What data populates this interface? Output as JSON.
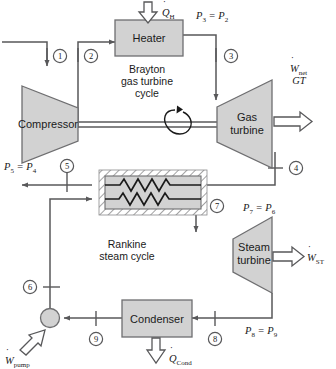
{
  "diagram": {
    "colors": {
      "line": "#58585a",
      "component_fill": "#d2d2d2",
      "component_stroke": "#6e6e70",
      "hatch_stroke": "#8a8a8c",
      "text": "#1a1a1a",
      "background": "#ffffff"
    },
    "cycles": {
      "brayton": {
        "line1": "Brayton",
        "line2": "gas turbine",
        "line3": "cycle"
      },
      "rankine": {
        "line1": "Rankine",
        "line2": "steam cycle"
      }
    },
    "components": {
      "heater": "Heater",
      "compressor": "Compressor",
      "gas_turbine_line1": "Gas",
      "gas_turbine_line2": "turbine",
      "steam_turbine_line1": "Steam",
      "steam_turbine_line2": "turbine",
      "condenser": "Condenser",
      "heat_exchanger": "heat-exchanger-coils",
      "pump": "pump"
    },
    "energy_flows": {
      "q_h": {
        "symbol": "Q",
        "subscript": "H",
        "dotted": true
      },
      "w_net_gt": {
        "symbol": "W",
        "subscript": "net",
        "second_line": "GT",
        "dotted": true
      },
      "w_st": {
        "symbol": "W",
        "subscript": "ST",
        "dotted": true
      },
      "w_pump": {
        "symbol": "W",
        "subscript": "pump",
        "dotted": true
      },
      "q_cond": {
        "symbol": "Q",
        "subscript": "Cond",
        "dotted": true
      }
    },
    "state_points": [
      {
        "id": "1",
        "label": "1"
      },
      {
        "id": "2",
        "label": "2"
      },
      {
        "id": "3",
        "label": "3"
      },
      {
        "id": "4",
        "label": "4"
      },
      {
        "id": "5",
        "label": "5"
      },
      {
        "id": "6",
        "label": "6"
      },
      {
        "id": "7",
        "label": "7"
      },
      {
        "id": "8",
        "label": "8"
      },
      {
        "id": "9",
        "label": "9"
      }
    ],
    "pressure_relations": [
      {
        "id": "p3p2",
        "left_sym": "P",
        "left_sub": "3",
        "right_sym": "P",
        "right_sub": "2"
      },
      {
        "id": "p5p4",
        "left_sym": "P",
        "left_sub": "5",
        "right_sym": "P",
        "right_sub": "4"
      },
      {
        "id": "p7p6",
        "left_sym": "P",
        "left_sub": "7",
        "right_sym": "P",
        "right_sub": "6"
      },
      {
        "id": "p8p9",
        "left_sym": "P",
        "left_sub": "8",
        "right_sym": "P",
        "right_sub": "9"
      }
    ]
  }
}
